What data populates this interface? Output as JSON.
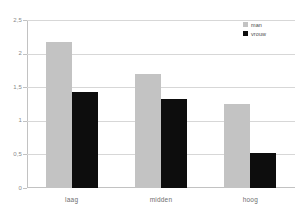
{
  "chart_data": {
    "type": "bar",
    "title": "",
    "subtitle": "",
    "xlabel": "",
    "ylabel": "",
    "categories": [
      "laag",
      "midden",
      "hoog"
    ],
    "series": [
      {
        "name": "man",
        "color": "#c3c3c3",
        "values": [
          2.17,
          1.7,
          1.25
        ]
      },
      {
        "name": "vrouw",
        "color": "#0d0d0d",
        "values": [
          1.43,
          1.33,
          0.52
        ]
      }
    ],
    "ylim": [
      0,
      2.5
    ],
    "ytick_values": [
      0,
      0.5,
      1,
      1.5,
      2,
      2.5
    ],
    "ytick_labels": [
      "0",
      "0,5",
      "1",
      "1,5",
      "2",
      "2,5"
    ],
    "grid": true,
    "grid_axis": "y",
    "legend_position": "top-right",
    "background_color": "#ffffff",
    "gridline_color": "#d7d7d7",
    "axis_color": "#c2c2c2",
    "tick_label_color": "#8a8a8a"
  }
}
